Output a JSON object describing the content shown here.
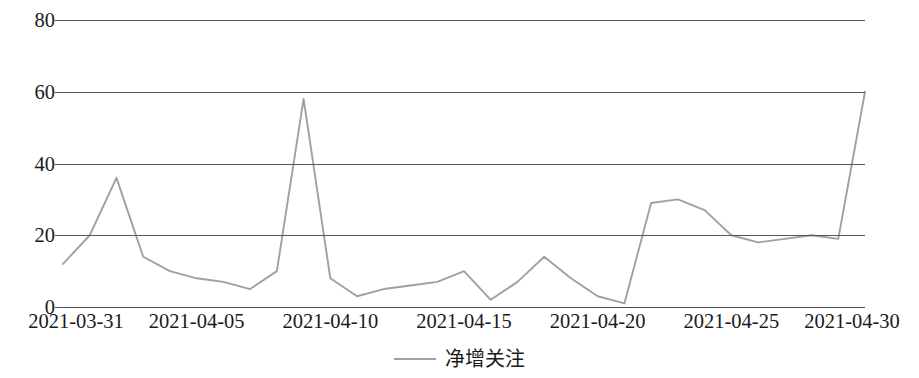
{
  "chart_data": {
    "type": "line",
    "title": "",
    "xlabel": "",
    "ylabel": "",
    "ylim": [
      0,
      80
    ],
    "yticks": [
      0,
      20,
      40,
      60,
      80
    ],
    "grid": true,
    "legend_position": "bottom-center",
    "line_color": "#a0a0a0",
    "grid_color": "#595959",
    "x": [
      "2021-03-31",
      "2021-04-01",
      "2021-04-02",
      "2021-04-03",
      "2021-04-04",
      "2021-04-05",
      "2021-04-06",
      "2021-04-07",
      "2021-04-08",
      "2021-04-09",
      "2021-04-10",
      "2021-04-11",
      "2021-04-12",
      "2021-04-13",
      "2021-04-14",
      "2021-04-15",
      "2021-04-16",
      "2021-04-17",
      "2021-04-18",
      "2021-04-19",
      "2021-04-20",
      "2021-04-21",
      "2021-04-22",
      "2021-04-23",
      "2021-04-24",
      "2021-04-25",
      "2021-04-26",
      "2021-04-27",
      "2021-04-28",
      "2021-04-29",
      "2021-04-30"
    ],
    "xtick_labels": [
      "2021-03-31",
      "2021-04-05",
      "2021-04-10",
      "2021-04-15",
      "2021-04-20",
      "2021-04-25",
      "2021-04-30"
    ],
    "xtick_indices": [
      0,
      5,
      10,
      15,
      20,
      25,
      30
    ],
    "series": [
      {
        "name": "净增关注",
        "values": [
          12,
          20,
          36,
          14,
          10,
          8,
          7,
          5,
          10,
          58,
          8,
          3,
          5,
          6,
          7,
          10,
          2,
          7,
          14,
          8,
          3,
          1,
          29,
          30,
          27,
          20,
          18,
          19,
          20,
          19,
          60
        ]
      }
    ]
  },
  "legend": {
    "label": "净增关注"
  }
}
